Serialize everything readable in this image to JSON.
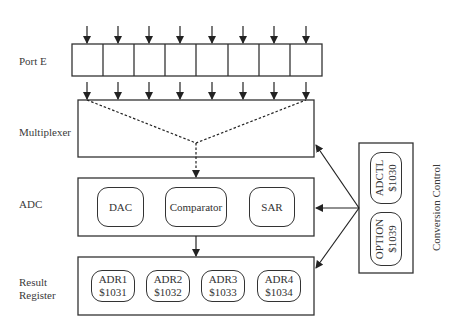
{
  "labels": {
    "port_e": "Port E",
    "multiplexer": "Multiplexer",
    "adc": "ADC",
    "result_register_line1": "Result",
    "result_register_line2": "Register",
    "conversion_control": "Conversion Control"
  },
  "adc_blocks": {
    "dac": "DAC",
    "comparator": "Comparator",
    "sar": "SAR"
  },
  "result_registers": [
    {
      "name": "ADR1",
      "address": "$1031"
    },
    {
      "name": "ADR2",
      "address": "$1032"
    },
    {
      "name": "ADR3",
      "address": "$1033"
    },
    {
      "name": "ADR4",
      "address": "$1034"
    }
  ],
  "control_registers": [
    {
      "name": "ADCTL",
      "address": "$1030"
    },
    {
      "name": "OPTION",
      "address": "$1039"
    }
  ],
  "port_e_bits": 8,
  "colors": {
    "line": "#333333",
    "background": "#ffffff"
  }
}
